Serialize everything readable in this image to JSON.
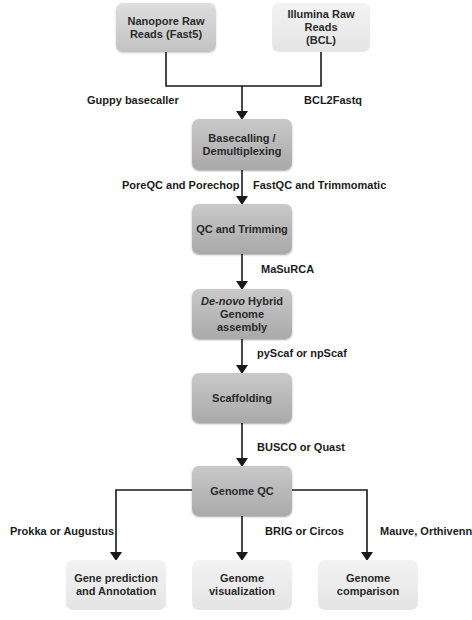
{
  "nodes": {
    "nanopore": "Nanopore Raw Reads (Fast5)",
    "nanopore_l1": "Nanopore Raw",
    "nanopore_l2": "Reads (Fast5)",
    "illumina_l1": "Illumina Raw Reads",
    "illumina_l2": "(BCL)",
    "basecalling_l1": "Basecalling /",
    "basecalling_l2": "Demultiplexing",
    "qc_trimming": "QC and Trimming",
    "denovo_italic": "De-novo",
    "denovo_rest": " Hybrid",
    "denovo_l2": "Genome assembly",
    "scaffolding": "Scaffolding",
    "genome_qc": "Genome QC",
    "gene_pred_l1": "Gene prediction",
    "gene_pred_l2": "and Annotation",
    "genome_viz_l1": "Genome",
    "genome_viz_l2": "visualization",
    "genome_comp_l1": "Genome",
    "genome_comp_l2": "comparison"
  },
  "edges": {
    "guppy": "Guppy basecaller",
    "bcl2fastq": "BCL2Fastq",
    "poreqc": "PoreQC and Porechop",
    "fastqc": "FastQC and Trimmomatic",
    "masurca": "MaSuRCA",
    "pyscaf": "pyScaf or npScaf",
    "busco": "BUSCO or Quast",
    "prokka": "Prokka or Augustus",
    "brig": "BRIG or Circos",
    "mauve": "Mauve, Orthivenn"
  },
  "colors": {
    "dark_box": "#b4b4b4",
    "light_box": "#eaeaea",
    "line": "#1a1a1a"
  }
}
